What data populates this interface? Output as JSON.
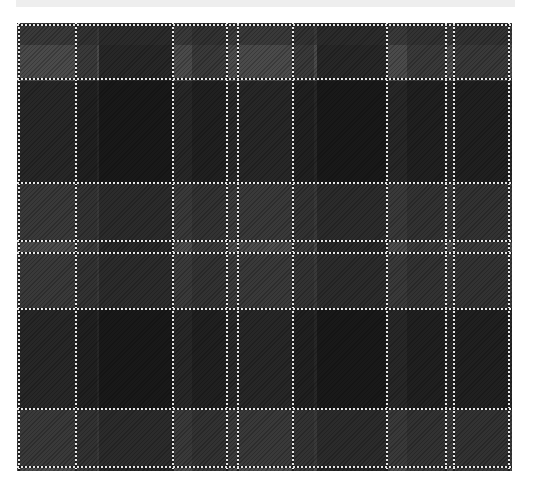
{
  "top_bar": {
    "text": ""
  },
  "tartan": {
    "colors": {
      "medium_gray": "#5a5a5a",
      "dark_gray": "#3a3a3a",
      "black": "#0a0a0a",
      "white_line": "#e6e6e6"
    },
    "vertical_lines_x": [
      1,
      58,
      155,
      209,
      220,
      275,
      369,
      428,
      436,
      491
    ],
    "horizontal_lines_y": [
      1,
      55,
      159,
      217,
      229,
      285,
      385,
      443
    ],
    "vertical_dark_bands": [
      {
        "x": 58,
        "w": 22,
        "c": "#2e2e2e"
      },
      {
        "x": 82,
        "w": 73,
        "c": "#111111"
      },
      {
        "x": 175,
        "w": 34,
        "c": "#2e2e2e"
      },
      {
        "x": 275,
        "w": 22,
        "c": "#2e2e2e"
      },
      {
        "x": 300,
        "w": 69,
        "c": "#111111"
      },
      {
        "x": 390,
        "w": 38,
        "c": "#2e2e2e"
      },
      {
        "x": 436,
        "w": 55,
        "c": "#2e2e2e"
      }
    ],
    "horizontal_dark_bands": [
      {
        "y": 0,
        "h": 22,
        "c": "#2e2e2e"
      },
      {
        "y": 58,
        "h": 101,
        "c": "#111111"
      },
      {
        "y": 160,
        "h": 57,
        "c": "#2e2e2e"
      },
      {
        "y": 229,
        "h": 56,
        "c": "#2e2e2e"
      },
      {
        "y": 285,
        "h": 100,
        "c": "#111111"
      },
      {
        "y": 386,
        "h": 57,
        "c": "#2e2e2e"
      }
    ]
  }
}
